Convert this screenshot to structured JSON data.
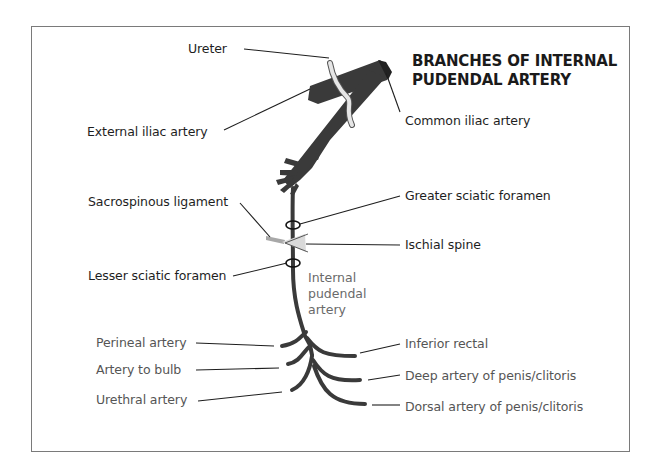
{
  "title": {
    "line1": "BRANCHES OF INTERNAL",
    "line2": "PUDENDAL ARTERY"
  },
  "labels": {
    "ureter": "Ureter",
    "external_iliac": "External iliac artery",
    "common_iliac": "Common iliac artery",
    "sacrospinous_ligament": "Sacrospinous ligament",
    "greater_sciatic_foramen": "Greater sciatic foramen",
    "ischial_spine": "Ischial spine",
    "lesser_sciatic_foramen": "Lesser sciatic foramen",
    "internal_pudendal": {
      "line1": "Internal",
      "line2": "pudendal",
      "line3": "artery"
    }
  },
  "branches": {
    "left": [
      {
        "label": "Perineal artery"
      },
      {
        "label": "Artery to bulb"
      },
      {
        "label": "Urethral artery"
      }
    ],
    "right": [
      {
        "label": "Inferior rectal"
      },
      {
        "label": "Deep artery of penis/clitoris"
      },
      {
        "label": "Dorsal artery of penis/clitoris"
      }
    ]
  },
  "colors": {
    "artery": "#3a3a3a",
    "ureter": "#e6e6e6",
    "ligament": "#a8a8a8",
    "ischial_spine": "#d9d9d9",
    "leader_line": "#1e1e1e",
    "frame": "#7a7a7a"
  }
}
